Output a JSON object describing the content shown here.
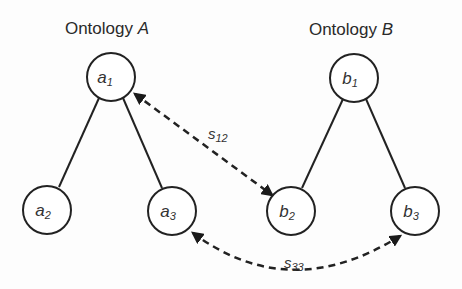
{
  "diagram": {
    "ontology_a": {
      "title_prefix": "Ontology ",
      "title_var": "A",
      "nodes": [
        {
          "id": "a1",
          "base": "a",
          "sub": "1"
        },
        {
          "id": "a2",
          "base": "a",
          "sub": "2"
        },
        {
          "id": "a3",
          "base": "a",
          "sub": "3"
        }
      ],
      "edges": [
        [
          "a1",
          "a2"
        ],
        [
          "a1",
          "a3"
        ]
      ]
    },
    "ontology_b": {
      "title_prefix": "Ontology ",
      "title_var": "B",
      "nodes": [
        {
          "id": "b1",
          "base": "b",
          "sub": "1"
        },
        {
          "id": "b2",
          "base": "b",
          "sub": "2"
        },
        {
          "id": "b3",
          "base": "b",
          "sub": "3"
        }
      ],
      "edges": [
        [
          "b1",
          "b2"
        ],
        [
          "b1",
          "b3"
        ]
      ]
    },
    "mappings": [
      {
        "from": "a1",
        "to": "b2",
        "label_base": "s",
        "label_sub": "12",
        "style": "dashed",
        "bidirectional": true
      },
      {
        "from": "a3",
        "to": "b3",
        "label_base": "s",
        "label_sub": "33",
        "style": "dashed-curved",
        "bidirectional": true
      }
    ]
  }
}
